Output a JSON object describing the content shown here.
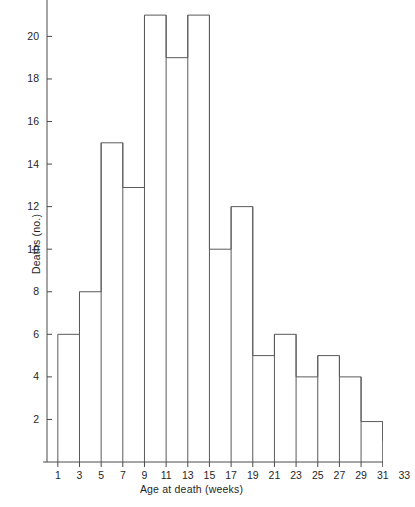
{
  "chart_data": {
    "type": "bar",
    "title": "",
    "subtitle": "",
    "xlabel": "Age at death (weeks)",
    "ylabel": "Deaths (no.)",
    "grid": false,
    "legend": null,
    "xlim": [
      0,
      34
    ],
    "ylim": [
      0,
      21.8
    ],
    "bin_width": 2,
    "x_tick_labels": [
      "1",
      "3",
      "5",
      "7",
      "9",
      "11",
      "13",
      "15",
      "17",
      "19",
      "21",
      "23",
      "25",
      "27",
      "29",
      "31",
      "33"
    ],
    "x_tick_values": [
      1,
      3,
      5,
      7,
      9,
      11,
      13,
      15,
      17,
      19,
      21,
      23,
      25,
      27,
      29,
      31,
      33
    ],
    "y_tick_labels": [
      "2",
      "4",
      "6",
      "8",
      "10",
      "12",
      "14",
      "16",
      "18",
      "20"
    ],
    "y_tick_values": [
      2,
      4,
      6,
      8,
      10,
      12,
      14,
      16,
      18,
      20
    ],
    "bin_edges": [
      1,
      3,
      5,
      7,
      9,
      11,
      13,
      15,
      17,
      19,
      21,
      23,
      25,
      27,
      29,
      31,
      33
    ],
    "categories": [
      "1-3",
      "3-5",
      "5-7",
      "7-9",
      "9-11",
      "11-13",
      "13-15",
      "15-17",
      "17-19",
      "19-21",
      "21-23",
      "23-25",
      "25-27",
      "27-29",
      "29-31",
      "31-33"
    ],
    "values": [
      6,
      8,
      15,
      12.9,
      21,
      19,
      21,
      10,
      12,
      5,
      6,
      4,
      5,
      4,
      1.9,
      1
    ],
    "series": [
      {
        "name": "Deaths",
        "values": [
          6,
          8,
          15,
          12.9,
          21,
          19,
          21,
          10,
          12,
          5,
          6,
          4,
          5,
          4,
          1.9,
          1
        ]
      }
    ],
    "colors": {
      "bar_stroke": "#5a5a5a",
      "bar_fill": "none",
      "axis": "#4a4a4a",
      "text": "#1f1f1f",
      "background": "#ffffff"
    }
  },
  "axes": {
    "y_label": "Deaths (no.)",
    "x_label": "Age at death (weeks)"
  }
}
